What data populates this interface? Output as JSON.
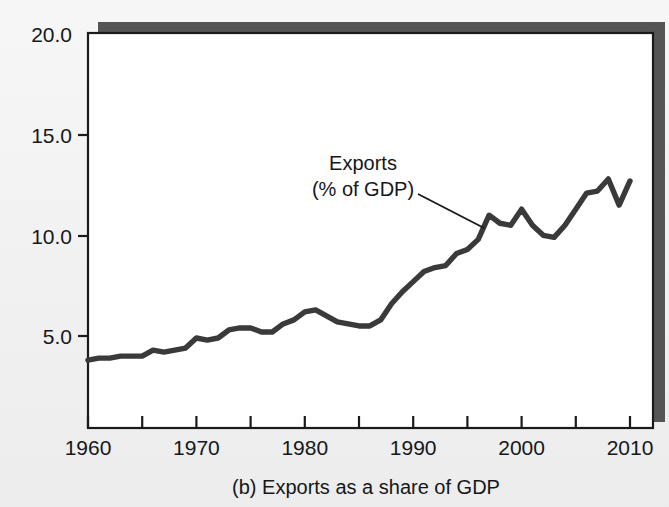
{
  "figure": {
    "caption": "(b) Exports as a share of GDP",
    "panel_label": "(b)",
    "background_color": "#ececec",
    "plot_background_color": "#ffffff",
    "shadow_color": "#555555",
    "frame_color": "#1a1a1a",
    "line_color": "#3a3a3a"
  },
  "annotation": {
    "line1": "Exports",
    "line2": "(% of GDP)",
    "leader_from_x": 418,
    "leader_from_y": 194,
    "leader_to_x": 484,
    "leader_to_y": 228
  },
  "chart_data": {
    "type": "line",
    "title": "(b) Exports as a share of GDP",
    "xlabel": "",
    "ylabel": "",
    "ylim": [
      0.0,
      20.0
    ],
    "xlim": [
      1960,
      2010
    ],
    "grid": false,
    "legend_position": "inline-annotation",
    "ytick_labels": [
      "20.0",
      "15.0",
      "10.0",
      "5.0"
    ],
    "ytick_values": [
      20.0,
      15.0,
      10.0,
      5.0
    ],
    "xtick_labels": [
      "1960",
      "1970",
      "1980",
      "1990",
      "2000",
      "2010"
    ],
    "xtick_values": [
      1960,
      1970,
      1980,
      1990,
      2000,
      2010
    ],
    "xminor_tick_values": [
      1965,
      1975,
      1985,
      1995,
      2005
    ],
    "series": [
      {
        "name": "Exports (% of GDP)",
        "x": [
          1960,
          1961,
          1962,
          1963,
          1964,
          1965,
          1966,
          1967,
          1968,
          1969,
          1970,
          1971,
          1972,
          1973,
          1974,
          1975,
          1976,
          1977,
          1978,
          1979,
          1980,
          1981,
          1982,
          1983,
          1984,
          1985,
          1986,
          1987,
          1988,
          1989,
          1990,
          1991,
          1992,
          1993,
          1994,
          1995,
          1996,
          1997,
          1998,
          1999,
          2000,
          2001,
          2002,
          2003,
          2004,
          2005,
          2006,
          2007,
          2008,
          2009,
          2010
        ],
        "values": [
          3.8,
          3.9,
          3.9,
          4.0,
          4.0,
          4.0,
          4.3,
          4.2,
          4.3,
          4.4,
          4.9,
          4.8,
          4.9,
          5.3,
          5.4,
          5.4,
          5.2,
          5.2,
          5.6,
          5.8,
          6.2,
          6.3,
          6.0,
          5.7,
          5.6,
          5.5,
          5.5,
          5.8,
          6.6,
          7.2,
          7.7,
          8.2,
          8.4,
          8.5,
          9.1,
          9.3,
          9.8,
          11.0,
          10.6,
          10.5,
          11.3,
          10.5,
          10.0,
          9.9,
          10.5,
          11.3,
          12.1,
          12.2,
          12.8,
          11.5,
          12.7
        ]
      }
    ]
  }
}
